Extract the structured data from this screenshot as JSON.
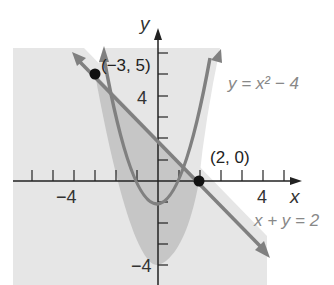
{
  "figure": {
    "axes": {
      "x_label": "x",
      "y_label": "y",
      "x_tick_label_neg": "−4",
      "x_tick_label_pos": "4",
      "y_tick_label_pos": "4",
      "y_tick_label_neg": "−4"
    },
    "curves": [
      {
        "label": "y = x² − 4",
        "type": "parabola"
      },
      {
        "label": "x + y = 2",
        "type": "line"
      }
    ],
    "points": [
      {
        "label": "(−3, 5)",
        "x": -3,
        "y": 5
      },
      {
        "label": "(2, 0)",
        "x": 2,
        "y": 0
      }
    ],
    "colors": {
      "light_shade": "#e6e6e6",
      "dark_shade": "#c8c8c8",
      "curve": "#808080",
      "axis": "#222222",
      "label": "#888888"
    }
  }
}
